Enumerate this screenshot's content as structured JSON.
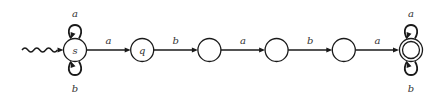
{
  "diagram": {
    "type": "finite-automaton",
    "start_state": "s",
    "states": [
      {
        "id": "s",
        "label": "s",
        "accepting": false
      },
      {
        "id": "q",
        "label": "q",
        "accepting": false
      },
      {
        "id": "n3",
        "label": "",
        "accepting": false
      },
      {
        "id": "n4",
        "label": "",
        "accepting": false
      },
      {
        "id": "n5",
        "label": "",
        "accepting": false
      },
      {
        "id": "f",
        "label": "",
        "accepting": true
      }
    ],
    "transitions": [
      {
        "from": "s",
        "to": "q",
        "label": "a"
      },
      {
        "from": "q",
        "to": "n3",
        "label": "b"
      },
      {
        "from": "n3",
        "to": "n4",
        "label": "a"
      },
      {
        "from": "n4",
        "to": "n5",
        "label": "b"
      },
      {
        "from": "n5",
        "to": "f",
        "label": "a"
      }
    ],
    "self_loops": [
      {
        "state": "s",
        "position": "top",
        "label": "a"
      },
      {
        "state": "s",
        "position": "bottom",
        "label": "b"
      },
      {
        "state": "f",
        "position": "top",
        "label": "a"
      },
      {
        "state": "f",
        "position": "bottom",
        "label": "b"
      }
    ],
    "colors": {
      "stroke": "#1a1a1a",
      "text": "#333333",
      "background": "#ffffff"
    }
  }
}
